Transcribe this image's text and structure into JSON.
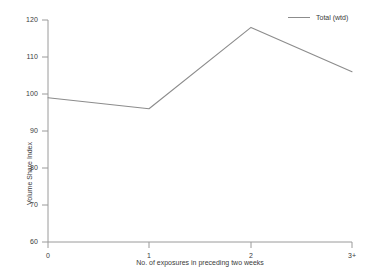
{
  "chart_data": {
    "type": "line",
    "title": "",
    "xlabel": "No. of exposures in preceding two weeks",
    "ylabel": "Volume Share Index",
    "categories": [
      "0",
      "1",
      "2",
      "3+"
    ],
    "xticks": [
      "0",
      "1",
      "2",
      "3+"
    ],
    "yticks": [
      "60",
      "70",
      "80",
      "90",
      "100",
      "110",
      "120"
    ],
    "ylim": [
      60,
      120
    ],
    "grid": false,
    "legend_position": "top-right",
    "series": [
      {
        "name": "Total (wtd)",
        "color": "#8c8c8c",
        "values": [
          99,
          96,
          118,
          106
        ]
      }
    ]
  },
  "legend": {
    "entries": [
      {
        "label": "Total (wtd)",
        "color": "#8c8c8c"
      }
    ]
  },
  "axes": {
    "y_label": "Volume Share Index",
    "x_label": "No. of exposures in preceding two weeks",
    "y_ticks": [
      "120",
      "110",
      "100",
      "90",
      "80",
      "70",
      "60"
    ],
    "x_ticks": [
      "0",
      "1",
      "2",
      "3+"
    ]
  },
  "colors": {
    "line": "#8c8c8c",
    "axis": "#9a9a9a",
    "text": "#3a3a3a",
    "background": "#ffffff"
  }
}
